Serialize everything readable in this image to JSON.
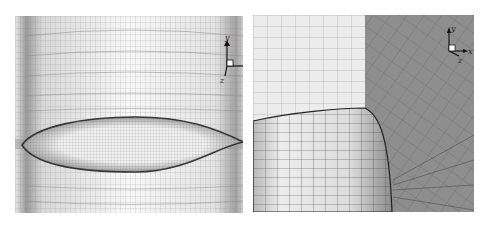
{
  "figure": {
    "panels": [
      {
        "id": "left",
        "description": "Structured surface mesh around airfoil-shaped strut section on cylinder",
        "axes": {
          "x": "x",
          "y": "y",
          "z": "z"
        }
      },
      {
        "id": "right",
        "description": "Close-up of cylinder junction with surrounding mesh",
        "axes": {
          "x": "x",
          "y": "y",
          "z": "z"
        }
      }
    ]
  },
  "colors": {
    "background": "#ffffff",
    "mesh_line": "#555555",
    "light_surface": "#f4f4f4",
    "dark_surface": "#8a8a8a",
    "axis": "#111111"
  }
}
